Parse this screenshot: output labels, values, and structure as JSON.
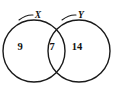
{
  "diagram": {
    "type": "venn-two-set",
    "background_color": "#ffffff",
    "stroke_color": "#1a1a1a",
    "text_color": "#111111",
    "sets": [
      {
        "name": "set-x",
        "label": "X",
        "label_x": 38,
        "label_y": 16,
        "center_x": 34,
        "center_y": 51,
        "radius": 31,
        "leader_from_x": 19,
        "leader_from_y": 20,
        "leader_to_x": 33,
        "leader_to_y": 15
      },
      {
        "name": "set-y",
        "label": "Y",
        "label_x": 81,
        "label_y": 16,
        "center_x": 79,
        "center_y": 51,
        "radius": 31,
        "leader_from_x": 62,
        "leader_from_y": 20,
        "leader_to_x": 76,
        "leader_to_y": 15
      }
    ],
    "regions": [
      {
        "name": "region-x-only",
        "value": "9",
        "x": 20,
        "y": 48
      },
      {
        "name": "region-intersection",
        "value": "7",
        "x": 52,
        "y": 48
      },
      {
        "name": "region-y-only",
        "value": "14",
        "x": 77,
        "y": 48
      }
    ]
  }
}
